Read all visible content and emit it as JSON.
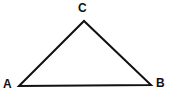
{
  "figure": {
    "name": "triangle-abc",
    "type": "geometry-diagram",
    "background_color": "#ffffff",
    "stroke_color": "#111111",
    "stroke_width": 2,
    "width": 169,
    "height": 97
  },
  "labels": {
    "a": "A",
    "b": "B",
    "c": "C"
  },
  "geometry": {
    "vertices": [
      {
        "id": "A",
        "x": 19,
        "y": 86
      },
      {
        "id": "B",
        "x": 151,
        "y": 85
      },
      {
        "id": "C",
        "x": 84,
        "y": 21
      }
    ],
    "edges": [
      {
        "id": "AC",
        "from": "A",
        "to": "C"
      },
      {
        "id": "CB",
        "from": "C",
        "to": "B"
      },
      {
        "id": "AB",
        "from": "A",
        "to": "B"
      }
    ],
    "polygon_points": "19,86 84,21 151,85"
  }
}
